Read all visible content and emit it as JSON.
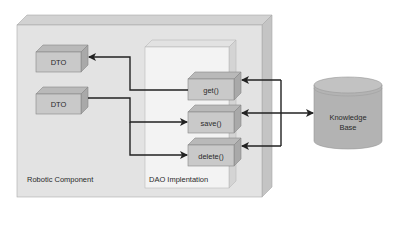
{
  "diagram": {
    "containers": {
      "robotic_component": {
        "label": "Robotic Component"
      },
      "dao_implementation": {
        "label": "DAO Implentation"
      }
    },
    "dtos": [
      {
        "label": "DTO"
      },
      {
        "label": "DTO"
      }
    ],
    "methods": [
      {
        "label": "get()"
      },
      {
        "label": "save()"
      },
      {
        "label": "delete()"
      }
    ],
    "database": {
      "label_line1": "Knowledge",
      "label_line2": "Base"
    },
    "connections": [
      {
        "from": "get()",
        "to": "DTO (top)",
        "direction": "to-dto"
      },
      {
        "from": "DTO (bottom)",
        "to": "save()",
        "direction": "to-method"
      },
      {
        "from": "DTO (bottom)",
        "to": "delete()",
        "direction": "to-method"
      },
      {
        "from": "Knowledge Base",
        "to": "get()",
        "direction": "to-method"
      },
      {
        "from": "save()",
        "to": "Knowledge Base",
        "direction": "bidirectional"
      },
      {
        "from": "Knowledge Base",
        "to": "delete()",
        "direction": "to-method"
      }
    ],
    "colors": {
      "outer_face": "#e3e3e3",
      "outer_top": "#d2d2d2",
      "outer_side": "#c4c4c4",
      "dao_face": "#f3f3f3",
      "dao_top": "#e2e2e2",
      "dao_side": "#d4d4d4",
      "box_face": "#c9c9c9",
      "box_top": "#b9b9b9",
      "box_side": "#a9a9a9",
      "db_body": "#b3b3b3",
      "db_top": "#c2c2c2",
      "arrow": "#222222"
    }
  }
}
